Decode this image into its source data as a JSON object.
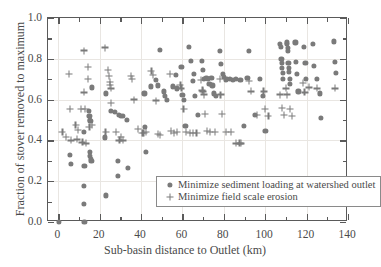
{
  "chart_data": {
    "type": "scatter",
    "title": "",
    "xlabel": "Sub-basin distance to Outlet (km)",
    "ylabel": "Fraction of stover removed to maximum",
    "xlim": [
      -5,
      140
    ],
    "ylim": [
      0.0,
      1.0
    ],
    "xticks": [
      0,
      20,
      40,
      60,
      80,
      100,
      120,
      140
    ],
    "xticklabels": [
      "0",
      "20",
      "40",
      "60",
      "80",
      "100",
      "120",
      "140"
    ],
    "yticks": [
      0.0,
      0.2,
      0.4,
      0.6,
      0.8,
      1.0
    ],
    "yticklabels": [
      "0.0",
      "0.2",
      "0.4",
      "0.6",
      "0.8",
      "1.0"
    ],
    "x_minor_ticks": [
      10,
      30,
      50,
      70,
      90,
      110,
      130
    ],
    "y_minor_ticks": [
      0.1,
      0.3,
      0.5,
      0.7,
      0.9
    ],
    "grid": true,
    "grid_color": "#e9e6e2",
    "marker_color": "#7a7a7a",
    "legend_position": "lower right",
    "legend": [
      {
        "marker": "circle",
        "label": "Minimize sediment loading at watershed outlet"
      },
      {
        "marker": "plus",
        "label": "Minimize field scale erosion"
      }
    ],
    "series": [
      {
        "name": "Minimize sediment loading at watershed outlet",
        "marker": "circle",
        "points": [
          [
            0.4,
            0.0
          ],
          [
            12.6,
            0.0
          ],
          [
            5.5,
            0.33
          ],
          [
            5.9,
            0.285
          ],
          [
            12.3,
            0.09
          ],
          [
            12.4,
            0.175
          ],
          [
            12.6,
            0.275
          ],
          [
            12.5,
            0.44
          ],
          [
            15.2,
            0.345
          ],
          [
            15.4,
            0.325
          ],
          [
            15.8,
            0.31
          ],
          [
            16.0,
            0.3
          ],
          [
            15.0,
            0.52
          ],
          [
            15.3,
            0.5
          ],
          [
            15.5,
            0.495
          ],
          [
            14.8,
            0.545
          ],
          [
            16.3,
            0.66
          ],
          [
            23.1,
            0.13
          ],
          [
            22.6,
            0.415
          ],
          [
            23.0,
            0.63
          ],
          [
            25.6,
            0.545
          ],
          [
            27.2,
            0.54
          ],
          [
            28.6,
            0.3
          ],
          [
            28.9,
            0.225
          ],
          [
            29.1,
            0.525
          ],
          [
            30.2,
            0.52
          ],
          [
            31.4,
            0.52
          ],
          [
            33.5,
            0.265
          ],
          [
            33.1,
            0.5
          ],
          [
            42.3,
            0.345
          ],
          [
            42.0,
            0.465
          ],
          [
            41.6,
            0.63
          ],
          [
            44.7,
            0.665
          ],
          [
            47.0,
            0.695
          ],
          [
            48.2,
            0.67
          ],
          [
            49.1,
            0.845
          ],
          [
            51.0,
            0.64
          ],
          [
            51.6,
            0.62
          ],
          [
            52.6,
            0.6
          ],
          [
            55.3,
            0.665
          ],
          [
            57.0,
            0.72
          ],
          [
            57.4,
            0.655
          ],
          [
            59.5,
            0.76
          ],
          [
            60.0,
            0.625
          ],
          [
            60.8,
            0.6
          ],
          [
            61.4,
            0.47
          ],
          [
            63.0,
            0.86
          ],
          [
            64.2,
            0.79
          ],
          [
            65.4,
            0.725
          ],
          [
            65.0,
            0.69
          ],
          [
            66.0,
            0.62
          ],
          [
            67.6,
            0.525
          ],
          [
            69.3,
            0.79
          ],
          [
            70.0,
            0.745
          ],
          [
            70.4,
            0.7
          ],
          [
            71.6,
            0.705
          ],
          [
            72.4,
            0.7
          ],
          [
            73.0,
            0.675
          ],
          [
            74.0,
            0.705
          ],
          [
            74.5,
            0.67
          ],
          [
            75.2,
            0.63
          ],
          [
            76.0,
            0.62
          ],
          [
            78.1,
            0.84
          ],
          [
            78.6,
            0.775
          ],
          [
            79.4,
            0.725
          ],
          [
            80.2,
            0.71
          ],
          [
            80.9,
            0.695
          ],
          [
            81.6,
            0.7
          ],
          [
            83.0,
            0.7
          ],
          [
            84.5,
            0.695
          ],
          [
            86.0,
            0.7
          ],
          [
            88.0,
            0.695
          ],
          [
            89.5,
            0.47
          ],
          [
            91.4,
            0.705
          ],
          [
            92.0,
            0.84
          ],
          [
            95.0,
            0.525
          ],
          [
            97.6,
            0.7
          ],
          [
            99.0,
            0.62
          ],
          [
            100.1,
            0.445
          ],
          [
            107.2,
            0.875
          ],
          [
            107.6,
            0.86
          ],
          [
            107.8,
            0.8
          ],
          [
            108.0,
            0.78
          ],
          [
            108.2,
            0.755
          ],
          [
            108.4,
            0.73
          ],
          [
            108.5,
            0.7
          ],
          [
            110.4,
            0.88
          ],
          [
            110.6,
            0.875
          ],
          [
            110.8,
            0.855
          ],
          [
            111.0,
            0.84
          ],
          [
            111.2,
            0.78
          ],
          [
            111.4,
            0.755
          ],
          [
            111.6,
            0.735
          ],
          [
            111.8,
            0.7
          ],
          [
            112.0,
            0.675
          ],
          [
            114.6,
            0.88
          ],
          [
            115.0,
            0.785
          ],
          [
            115.4,
            0.725
          ],
          [
            116.0,
            0.64
          ],
          [
            118.8,
            0.86
          ],
          [
            119.4,
            0.78
          ],
          [
            119.8,
            0.7
          ],
          [
            123.0,
            0.875
          ],
          [
            123.5,
            0.765
          ],
          [
            125.0,
            0.7
          ],
          [
            126.5,
            0.63
          ],
          [
            127.0,
            0.51
          ],
          [
            133.0,
            0.885
          ],
          [
            133.6,
            0.785
          ],
          [
            134.0,
            0.73
          ]
        ]
      },
      {
        "name": "Minimize field scale erosion",
        "marker": "plus",
        "points": [
          [
            5.3,
            0.725
          ],
          [
            5.6,
            0.555
          ],
          [
            8.3,
            0.475
          ],
          [
            9.6,
            0.45
          ],
          [
            11.1,
            0.555
          ],
          [
            12.3,
            0.84
          ],
          [
            12.5,
            0.635
          ],
          [
            13.0,
            0.555
          ],
          [
            14.2,
            0.76
          ],
          [
            14.4,
            0.7
          ],
          [
            15.0,
            0.465
          ],
          [
            16.3,
            0.475
          ],
          [
            22.6,
            0.855
          ],
          [
            22.8,
            0.44
          ],
          [
            24.1,
            0.745
          ],
          [
            24.5,
            0.715
          ],
          [
            24.8,
            0.685
          ],
          [
            25.0,
            0.67
          ],
          [
            25.3,
            0.655
          ],
          [
            25.6,
            0.585
          ],
          [
            28.0,
            0.44
          ],
          [
            29.5,
            0.4
          ],
          [
            30.4,
            0.415
          ],
          [
            31.1,
            0.4
          ],
          [
            35.2,
            0.715
          ],
          [
            35.6,
            0.7
          ],
          [
            36.6,
            0.6
          ],
          [
            38.6,
            0.455
          ],
          [
            40.6,
            0.435
          ],
          [
            41.2,
            0.435
          ],
          [
            42.4,
            0.44
          ],
          [
            45.0,
            0.74
          ],
          [
            45.6,
            0.72
          ],
          [
            47.2,
            0.595
          ],
          [
            48.3,
            0.43
          ],
          [
            49.0,
            0.425
          ],
          [
            54.0,
            0.725
          ],
          [
            54.5,
            0.445
          ],
          [
            56.0,
            0.435
          ],
          [
            57.2,
            0.44
          ],
          [
            59.0,
            0.67
          ],
          [
            59.5,
            0.655
          ],
          [
            60.5,
            0.555
          ],
          [
            61.6,
            0.44
          ],
          [
            63.6,
            0.435
          ],
          [
            65.2,
            0.435
          ],
          [
            66.8,
            0.435
          ],
          [
            69.0,
            0.695
          ],
          [
            69.6,
            0.645
          ],
          [
            70.0,
            0.64
          ],
          [
            70.4,
            0.625
          ],
          [
            71.0,
            0.53
          ],
          [
            72.0,
            0.445
          ],
          [
            73.4,
            0.44
          ],
          [
            75.6,
            0.44
          ],
          [
            78.0,
            0.7
          ],
          [
            78.4,
            0.625
          ],
          [
            79.0,
            0.53
          ],
          [
            81.0,
            0.44
          ],
          [
            83.4,
            0.44
          ],
          [
            87.6,
            0.385
          ],
          [
            88.4,
            0.385
          ],
          [
            92.0,
            0.69
          ],
          [
            93.0,
            0.64
          ],
          [
            96.0,
            0.525
          ],
          [
            99.2,
            0.64
          ],
          [
            100.0,
            0.555
          ],
          [
            101.5,
            0.52
          ],
          [
            107.0,
            0.625
          ],
          [
            108.0,
            0.56
          ],
          [
            109.0,
            0.525
          ],
          [
            110.0,
            0.655
          ],
          [
            110.6,
            0.625
          ],
          [
            112.0,
            0.555
          ],
          [
            113.0,
            0.52
          ],
          [
            118.2,
            0.68
          ],
          [
            119.0,
            0.635
          ],
          [
            121.0,
            0.66
          ],
          [
            125.0,
            0.655
          ],
          [
            133.6,
            0.655
          ],
          [
            2.0,
            0.44
          ],
          [
            3.6,
            0.415
          ],
          [
            6.0,
            0.4
          ],
          [
            9.0,
            0.405
          ],
          [
            11.6,
            0.39
          ],
          [
            13.4,
            0.385
          ],
          [
            86.0,
            0.385
          ]
        ]
      }
    ]
  }
}
